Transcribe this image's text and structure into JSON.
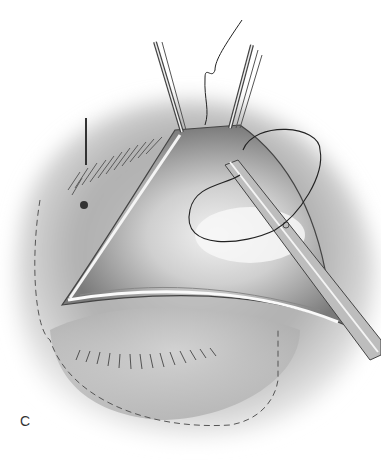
{
  "figure": {
    "panel_label": "C",
    "colors": {
      "skin_shadow": "#8a8a8a",
      "skin_light": "#d8d8d8",
      "instrument": "#555555",
      "suture": "#222222",
      "dashed_outline": "#555555"
    }
  }
}
